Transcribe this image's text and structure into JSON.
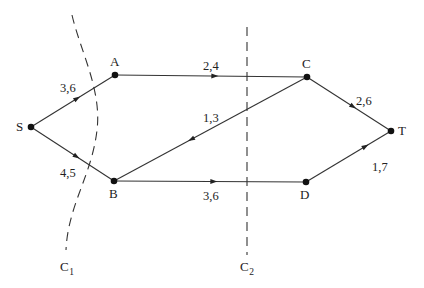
{
  "diagram": {
    "type": "flow-network",
    "nodes": [
      {
        "id": "S",
        "label": "S",
        "x": 31,
        "y": 127,
        "lx": 16,
        "ly": 131
      },
      {
        "id": "A",
        "label": "A",
        "x": 115,
        "y": 75,
        "lx": 110,
        "ly": 66
      },
      {
        "id": "C",
        "label": "C",
        "x": 307,
        "y": 77,
        "lx": 302,
        "ly": 68
      },
      {
        "id": "T",
        "label": "T",
        "x": 391,
        "y": 131,
        "lx": 398,
        "ly": 135
      },
      {
        "id": "B",
        "label": "B",
        "x": 114,
        "y": 181,
        "lx": 109,
        "ly": 198
      },
      {
        "id": "D",
        "label": "D",
        "x": 306,
        "y": 182,
        "lx": 300,
        "ly": 199
      }
    ],
    "edges": [
      {
        "from": "S",
        "to": "A",
        "label": "3,6",
        "arrow_t": 0.55,
        "lx": 60,
        "ly": 92
      },
      {
        "from": "A",
        "to": "C",
        "label": "2,4",
        "arrow_t": 0.52,
        "lx": 203,
        "ly": 70
      },
      {
        "from": "C",
        "to": "B",
        "label": "1,3",
        "arrow_t": 0.6,
        "lx": 203,
        "ly": 122
      },
      {
        "from": "C",
        "to": "T",
        "label": "2,6",
        "arrow_t": 0.55,
        "lx": 356,
        "ly": 105
      },
      {
        "from": "S",
        "to": "B",
        "label": "4,5",
        "arrow_t": 0.55,
        "lx": 60,
        "ly": 177
      },
      {
        "from": "B",
        "to": "D",
        "label": "3,6",
        "arrow_t": 0.52,
        "lx": 203,
        "ly": 200
      },
      {
        "from": "D",
        "to": "T",
        "label": "1,7",
        "arrow_t": 0.7,
        "lx": 372,
        "ly": 171
      }
    ],
    "cuts": [
      {
        "id": "C1",
        "label": "C",
        "subscript": "1",
        "path": "M 72 15 C 80 50, 102 90, 97 130 C 92 175, 68 205, 66 250",
        "lx": 60,
        "ly": 271
      },
      {
        "id": "C2",
        "label": "C",
        "subscript": "2",
        "path": "M 247 27 L 247 255",
        "lx": 240,
        "ly": 271
      }
    ],
    "colors": {
      "line": "#333333",
      "node": "#111111",
      "text": "#222222",
      "background": "#ffffff"
    }
  }
}
